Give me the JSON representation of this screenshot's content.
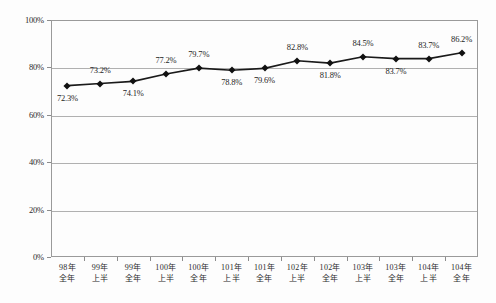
{
  "chart_data": {
    "type": "line",
    "title": "",
    "xlabel": "",
    "ylabel": "",
    "ylim": [
      0,
      100
    ],
    "ytick_labels": [
      "100%",
      "80%",
      "60%",
      "40%",
      "20%",
      "0%"
    ],
    "ytick_values": [
      100,
      80,
      60,
      40,
      20,
      0
    ],
    "grid": true,
    "legend": "none",
    "marker": "diamond",
    "line_color": "#1a1a1a",
    "marker_color": "#111111",
    "grid_color": "#b0b0b0",
    "categories": [
      "98年 全年",
      "99年 上半",
      "99年 全年",
      "100年 上半",
      "100年 全年",
      "101年 上半",
      "101年 全年",
      "102年 上半",
      "102年 全年",
      "103年 上半",
      "103年 全年",
      "104年 上半",
      "104年 全年"
    ],
    "category_lines": [
      [
        "98年",
        "全年"
      ],
      [
        "99年",
        "上半"
      ],
      [
        "99年",
        "全年"
      ],
      [
        "100年",
        "上半"
      ],
      [
        "100年",
        "全年"
      ],
      [
        "101年",
        "上半"
      ],
      [
        "101年",
        "全年"
      ],
      [
        "102年",
        "上半"
      ],
      [
        "102年",
        "全年"
      ],
      [
        "103年",
        "上半"
      ],
      [
        "103年",
        "全年"
      ],
      [
        "104年",
        "上半"
      ],
      [
        "104年",
        "全年"
      ]
    ],
    "values": [
      72.3,
      73.2,
      74.1,
      77.2,
      79.7,
      78.8,
      79.6,
      82.8,
      81.8,
      84.5,
      83.7,
      83.7,
      86.2
    ],
    "point_labels": [
      "72.3%",
      "73.2%",
      "74.1%",
      "77.2%",
      "79.7%",
      "78.8%",
      "79.6%",
      "82.8%",
      "81.8%",
      "84.5%",
      "83.7%",
      "83.7%",
      "86.2%"
    ],
    "label_positions": [
      "below",
      "above",
      "below",
      "above",
      "above",
      "below",
      "below",
      "above",
      "below",
      "above",
      "below",
      "above",
      "above"
    ]
  }
}
